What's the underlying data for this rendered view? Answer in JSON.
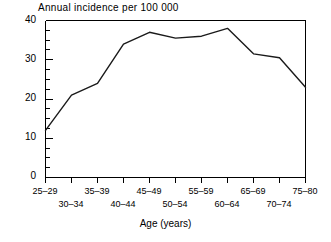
{
  "chart_data": {
    "type": "line",
    "title": "Annual incidence per 100 000",
    "xlabel": "Age (years)",
    "ylabel": "",
    "categories": [
      "25–29",
      "30–34",
      "35–39",
      "40–44",
      "45–49",
      "50–54",
      "55–59",
      "60–64",
      "65–69",
      "70–74",
      "75–80"
    ],
    "values": [
      12,
      21,
      24,
      34,
      37,
      35.5,
      36,
      38,
      31.5,
      30.5,
      23
    ],
    "series": [
      {
        "name": "Annual incidence per 100 000",
        "values": [
          12,
          21,
          24,
          34,
          37,
          35.5,
          36,
          38,
          31.5,
          30.5,
          23
        ]
      }
    ],
    "ylim": [
      0,
      40
    ],
    "yticks": [
      0,
      10,
      20,
      30,
      40
    ],
    "ytick_labels": [
      "0",
      "10",
      "20",
      "30",
      "40"
    ],
    "yminor_step": 2.5,
    "grid": false,
    "legend": false,
    "line_color": "#1a1a1a",
    "axis_color": "#000000",
    "xtick_label_rows": [
      {
        "row": 0,
        "labels": [
          "25–29",
          "35–39",
          "45–49",
          "55–59",
          "65–69",
          "75–80"
        ]
      },
      {
        "row": 1,
        "labels": [
          "30–34",
          "40–44",
          "50–54",
          "60–64",
          "70–74"
        ]
      }
    ]
  },
  "axes": {
    "y_labels": [
      "40",
      "30",
      "20",
      "10",
      "0"
    ],
    "x_labels_upper": [
      "25–29",
      "35–39",
      "45–49",
      "55–59",
      "65–69",
      "75–80"
    ],
    "x_labels_lower": [
      "30–34",
      "40–44",
      "50–54",
      "60–64",
      "70–74"
    ],
    "x_axis_title": "Age (years)"
  }
}
